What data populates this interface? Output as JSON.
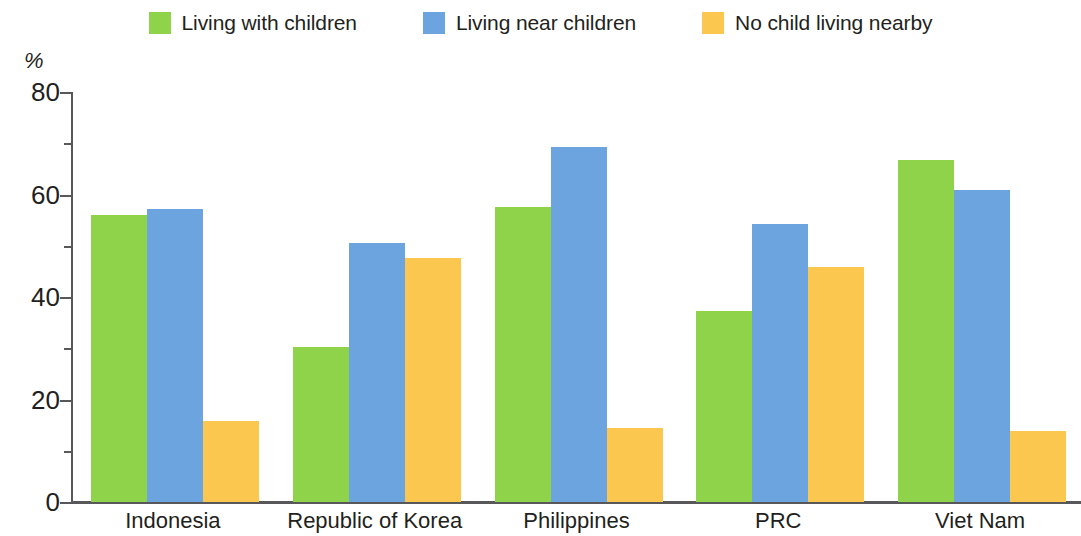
{
  "chart_data": {
    "type": "bar",
    "title": "",
    "subtitle": "",
    "xlabel": "",
    "ylabel": "%",
    "ylim": [
      0,
      80
    ],
    "yticks": [
      0,
      20,
      40,
      60,
      80
    ],
    "ytick_labels": [
      "0",
      "20",
      "40",
      "60",
      "80"
    ],
    "yminor_ticks": [
      10,
      30,
      50,
      70
    ],
    "grid": false,
    "legend_position": "top-center",
    "categories": [
      "Indonesia",
      "Republic of Korea",
      "Philippines",
      "PRC",
      "Viet Nam"
    ],
    "series": [
      {
        "name": "Living with children",
        "color": "#8FD34A",
        "values": [
          56.0,
          30.2,
          57.5,
          37.3,
          66.8
        ]
      },
      {
        "name": "Living near children",
        "color": "#6BA4DE",
        "values": [
          57.2,
          50.6,
          69.3,
          54.3,
          60.9
        ]
      },
      {
        "name": "No child living nearby",
        "color": "#FBC74E",
        "values": [
          15.9,
          47.6,
          14.4,
          45.8,
          13.9
        ]
      }
    ]
  },
  "axis": {
    "unit_label": "%",
    "axis_color": "#58585b"
  },
  "legend": {
    "items": [
      {
        "label": "Living with children",
        "color": "#8FD34A",
        "swatch_name": "legend-swatch-green"
      },
      {
        "label": "Living near children",
        "color": "#6BA4DE",
        "swatch_name": "legend-swatch-blue"
      },
      {
        "label": "No child living nearby",
        "color": "#FBC74E",
        "swatch_name": "legend-swatch-orange"
      }
    ]
  }
}
